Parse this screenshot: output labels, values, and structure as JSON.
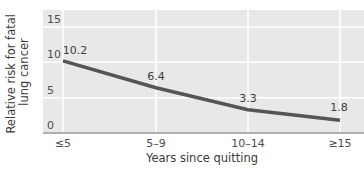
{
  "chart_data": {
    "type": "line",
    "title": "",
    "xlabel": "Years since quitting",
    "ylabel": "Relative risk for fatal lung cancer",
    "ylabel_lines": [
      "Relative risk for fatal",
      "lung cancer"
    ],
    "categories": [
      "≤5",
      "5–9",
      "10–14",
      "≥15"
    ],
    "series": [
      {
        "name": "Relative risk",
        "values": [
          10.2,
          6.4,
          3.3,
          1.8
        ],
        "labels": [
          "10.2",
          "6.4",
          "3.3",
          "1.8"
        ]
      }
    ],
    "ylim": [
      0,
      15
    ],
    "yticks": [
      0,
      5,
      10,
      15
    ],
    "ytick_labels": [
      "0",
      "5",
      "10",
      "15"
    ],
    "grid": true,
    "legend": "none"
  },
  "colors": {
    "plot_background": "#e8e8e8",
    "gridline": "#ffffff",
    "baseline": "#9a9a9a",
    "line": "#555555"
  }
}
